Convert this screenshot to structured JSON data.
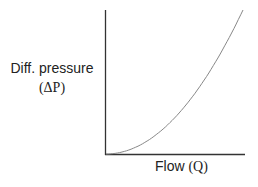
{
  "chart_data": {
    "type": "line",
    "title": "",
    "xlabel": "Flow (Q)",
    "ylabel": "Diff. pressure (ΔP)",
    "ylabel_line1": "Diff. pressure",
    "ylabel_line2": "(ΔP)",
    "xlabel_word": "Flow",
    "xlabel_sym": "(Q)",
    "grid": false,
    "legend": null,
    "xlim": [
      0,
      1
    ],
    "ylim": [
      0,
      1
    ],
    "relationship": "ΔP ∝ Q²",
    "series": [
      {
        "name": "ΔP vs Q",
        "x": [
          0,
          0.1,
          0.2,
          0.3,
          0.4,
          0.5,
          0.6,
          0.7,
          0.8,
          0.9,
          1.0
        ],
        "y": [
          0,
          0.01,
          0.04,
          0.09,
          0.16,
          0.25,
          0.36,
          0.49,
          0.64,
          0.81,
          1.0
        ],
        "color": "#888888"
      }
    ],
    "axis_color": "#333333"
  }
}
